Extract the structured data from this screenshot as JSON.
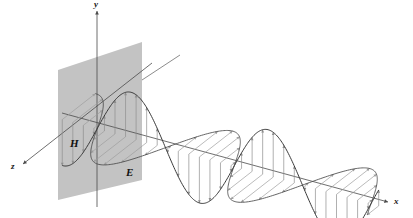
{
  "figure": {
    "type": "physics-diagram",
    "background_color": "#ffffff",
    "width": 413,
    "height": 218
  },
  "axes": {
    "origin": {
      "x": 97,
      "y": 129
    },
    "items": [
      {
        "name": "y",
        "label": "y",
        "label_x": 94,
        "label_y": 0,
        "direction": "up",
        "color": "#4a4a4a",
        "from": {
          "x": 97,
          "y": 11
        },
        "to": {
          "x": 97,
          "y": 207
        },
        "arrow_at": {
          "x": 97,
          "y": 11
        }
      },
      {
        "name": "x",
        "label": "x",
        "label_x": 394,
        "label_y": 197,
        "direction": "down-right",
        "color": "#4a4a4a",
        "from": {
          "x": 62,
          "y": 113
        },
        "to": {
          "x": 388,
          "y": 202
        },
        "arrow_at": {
          "x": 388,
          "y": 202
        }
      },
      {
        "name": "z",
        "label": "z",
        "label_x": 11,
        "label_y": 162,
        "direction": "down-left",
        "color": "#4a4a4a",
        "from": {
          "x": 152,
          "y": 63
        },
        "to": {
          "x": 23,
          "y": 164
        },
        "arrow_at": {
          "x": 23,
          "y": 164
        }
      }
    ]
  },
  "plane": {
    "name": "wavefront-plane",
    "fill_color": "#c3c3c3",
    "description": "shaded parallelogram representing the yz wavefront plane",
    "points": "58,70 142,42 142,180 58,200"
  },
  "waves": [
    {
      "name": "E",
      "label": "E",
      "label_x": 126,
      "label_y": 167,
      "description": "electric field, oscillating in the vertical xy-plane",
      "curve_color": "#3a3a3a",
      "vector_color": "#8e8e8e",
      "amplitude_px": 46,
      "wavelength_px": 142,
      "cycles": 2.1,
      "plane": "xy",
      "vector_count": 26
    },
    {
      "name": "H",
      "label": "H",
      "label_x": 70,
      "label_y": 138,
      "description": "magnetic field, oscillating in the horizontal xz-plane",
      "curve_color": "#4a4a4a",
      "vector_color": "#9d9d9d",
      "amplitude_px": 42,
      "wavelength_px": 142,
      "cycles": 2.1,
      "plane": "xz",
      "vector_count": 26
    }
  ],
  "chart_data": {
    "type": "line",
    "xlabel": "x",
    "ylabel": "y",
    "zlabel": "z",
    "series": [
      {
        "name": "E",
        "plane": "xy",
        "amplitude": 1.0,
        "phase": 0,
        "cycles": 2.1
      },
      {
        "name": "H",
        "plane": "xz",
        "amplitude": 1.0,
        "phase": 0,
        "cycles": 2.1
      }
    ],
    "legend": [
      "E",
      "H"
    ],
    "grid": false
  }
}
